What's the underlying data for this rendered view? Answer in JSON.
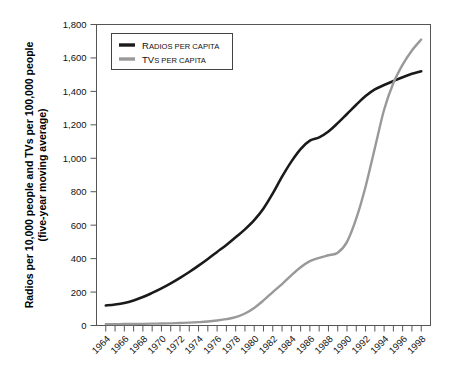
{
  "chart_data": {
    "type": "line",
    "title": "",
    "xlabel": "",
    "ylabel": "Radios per 10,000 people and TVs per 100,000 people",
    "ylabel_line2": "(five-year moving average)",
    "xlim": [
      1963,
      1999
    ],
    "ylim": [
      0,
      1800
    ],
    "ytick_step": 200,
    "grid": false,
    "legend_position": "top-left inside",
    "x": [
      1964,
      1965,
      1966,
      1967,
      1968,
      1969,
      1970,
      1971,
      1972,
      1973,
      1974,
      1975,
      1976,
      1977,
      1978,
      1979,
      1980,
      1981,
      1982,
      1983,
      1984,
      1985,
      1986,
      1987,
      1988,
      1989,
      1990,
      1991,
      1992,
      1993,
      1994,
      1995,
      1996,
      1997,
      1998
    ],
    "xtick_labels": [
      "1964",
      "1966",
      "1968",
      "1970",
      "1972",
      "1974",
      "1976",
      "1978",
      "1980",
      "1982",
      "1984",
      "1986",
      "1988",
      "1990",
      "1992",
      "1994",
      "1996",
      "1998"
    ],
    "ytick_labels": [
      "0",
      "200",
      "400",
      "600",
      "800",
      "1,000",
      "1,200",
      "1,400",
      "1,600",
      "1,800"
    ],
    "series": [
      {
        "name": "Radios per capita",
        "color": "#1a1a1a",
        "legend_lead": "R",
        "legend_rest_small": "ADIOS PER CAPITA",
        "values": [
          120,
          126,
          135,
          150,
          170,
          195,
          222,
          252,
          285,
          320,
          358,
          398,
          440,
          482,
          528,
          575,
          630,
          700,
          790,
          890,
          980,
          1055,
          1105,
          1125,
          1160,
          1210,
          1265,
          1320,
          1372,
          1412,
          1438,
          1462,
          1485,
          1505,
          1520
        ]
      },
      {
        "name": "TVs per capita",
        "color": "#999999",
        "legend_lead": "TV",
        "legend_rest_small": "S PER CAPITA",
        "values": [
          8,
          8,
          9,
          9,
          10,
          11,
          12,
          13,
          15,
          17,
          20,
          24,
          30,
          38,
          50,
          72,
          105,
          150,
          200,
          248,
          300,
          348,
          385,
          405,
          420,
          435,
          500,
          640,
          830,
          1060,
          1290,
          1450,
          1560,
          1645,
          1710
        ]
      }
    ]
  },
  "legend": {
    "items": [
      {
        "label": "RADIOS PER CAPITA"
      },
      {
        "label": "TVS PER CAPITA"
      }
    ]
  }
}
